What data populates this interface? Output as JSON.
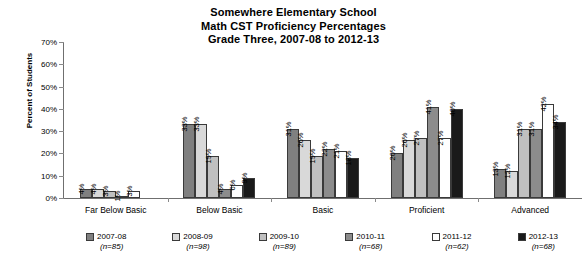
{
  "chart_data": {
    "type": "bar",
    "title": "Somewhere Elementary School Math CST Proficiency Percentages Grade Three, 2007-08 to 2012-13",
    "title_lines": [
      "Somewhere Elementary School",
      "Math CST Proficiency Percentages",
      "Grade Three, 2007-08 to 2012-13"
    ],
    "xlabel": "",
    "ylabel": "Percent of Students",
    "ylim": [
      0,
      70
    ],
    "ytick_labels": [
      "0%",
      "10%",
      "20%",
      "30%",
      "40%",
      "50%",
      "60%",
      "70%"
    ],
    "ytick_values": [
      0,
      10,
      20,
      30,
      40,
      50,
      60,
      70
    ],
    "grid": false,
    "legend_position": "bottom",
    "categories": [
      "Far Below Basic",
      "Below Basic",
      "Basic",
      "Proficient",
      "Advanced"
    ],
    "series": [
      {
        "name": "2007-08",
        "n": "(n=85)",
        "color": "#808080",
        "values": [
          4,
          33,
          31,
          20,
          13
        ],
        "labels": [
          "4%",
          "33%",
          "31%",
          "20%",
          "13%"
        ]
      },
      {
        "name": "2008-09",
        "n": "(n=98)",
        "color": "#d9d9d9",
        "values": [
          4,
          33,
          26,
          26,
          12
        ],
        "labels": [
          "4%",
          "33%",
          "26%",
          "26%",
          "12%"
        ]
      },
      {
        "name": "2009-10",
        "n": "(n=89)",
        "color": "#c0c0c0",
        "values": [
          3,
          19,
          19,
          27,
          31
        ],
        "labels": [
          "3%",
          "19%",
          "19%",
          "27%",
          "31%"
        ]
      },
      {
        "name": "2010-11",
        "n": "(n=68)",
        "color": "#8c8c8c",
        "values": [
          1,
          4,
          22,
          41,
          31
        ],
        "labels": [
          "1%",
          "4%",
          "22%",
          "41%",
          "31%"
        ]
      },
      {
        "name": "2011-12",
        "n": "(n=62)",
        "color": "#ffffff",
        "values": [
          3,
          6,
          21,
          27,
          42
        ],
        "labels": [
          "3%",
          "6%",
          "21%",
          "27%",
          "42%"
        ]
      },
      {
        "name": "2012-13",
        "n": "(n=68)",
        "color": "#1a1a1a",
        "values": [
          0,
          9,
          18,
          40,
          34
        ],
        "labels": [
          "",
          "9%",
          "18%",
          "40%",
          "34%"
        ]
      }
    ]
  }
}
